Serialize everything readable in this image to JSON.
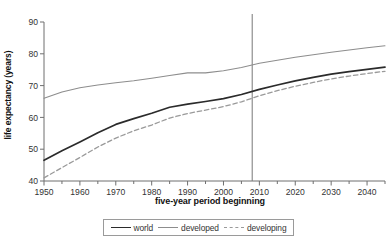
{
  "chart_data": {
    "type": "line",
    "title": "",
    "xlabel": "five-year period beginning",
    "ylabel": "life expectancy (years)",
    "xlim": [
      1950,
      2045
    ],
    "ylim": [
      40,
      90
    ],
    "xticks": [
      1950,
      1960,
      1970,
      1980,
      1990,
      2000,
      2010,
      2020,
      2030,
      2040
    ],
    "xtick_labels": [
      "1950",
      "1960",
      "1970",
      "1980",
      "1990",
      "2000",
      "2010",
      "2020",
      "2030",
      "2040"
    ],
    "minor_xtick_interval": 5,
    "yticks": [
      40,
      50,
      60,
      70,
      80,
      90
    ],
    "ytick_labels": [
      "40",
      "50",
      "60",
      "70",
      "80",
      "90"
    ],
    "grid": false,
    "legend_position": "below",
    "annotations": [
      {
        "name": "present-day-marker",
        "type": "vertical-line",
        "x": 2008,
        "color": "#777777"
      }
    ],
    "x": [
      1950,
      1955,
      1960,
      1965,
      1970,
      1975,
      1980,
      1985,
      1990,
      1995,
      2000,
      2005,
      2010,
      2015,
      2020,
      2025,
      2030,
      2035,
      2040,
      2045
    ],
    "series": [
      {
        "name": "world",
        "style": "solid",
        "color": "#2b2b2b",
        "values": [
          46.5,
          49.5,
          52.3,
          55.2,
          57.8,
          59.6,
          61.3,
          63.2,
          64.2,
          65.0,
          65.9,
          67.2,
          68.8,
          70.2,
          71.5,
          72.6,
          73.6,
          74.4,
          75.1,
          75.8
        ]
      },
      {
        "name": "developed",
        "style": "solid",
        "color": "#8d8d8d",
        "values": [
          66.0,
          68.0,
          69.3,
          70.2,
          70.9,
          71.5,
          72.3,
          73.2,
          74.0,
          74.0,
          74.7,
          75.7,
          77.0,
          78.0,
          78.9,
          79.7,
          80.5,
          81.2,
          81.9,
          82.5
        ]
      },
      {
        "name": "developing",
        "style": "dashed",
        "color": "#9a9a9a",
        "values": [
          41.0,
          44.2,
          47.4,
          50.7,
          53.5,
          55.8,
          57.6,
          59.8,
          61.2,
          62.3,
          63.4,
          64.9,
          66.8,
          68.4,
          69.8,
          71.0,
          72.1,
          73.0,
          73.8,
          74.5
        ]
      }
    ]
  },
  "legend": {
    "items": [
      {
        "label": "world"
      },
      {
        "label": "developed"
      },
      {
        "label": "developing"
      }
    ]
  }
}
